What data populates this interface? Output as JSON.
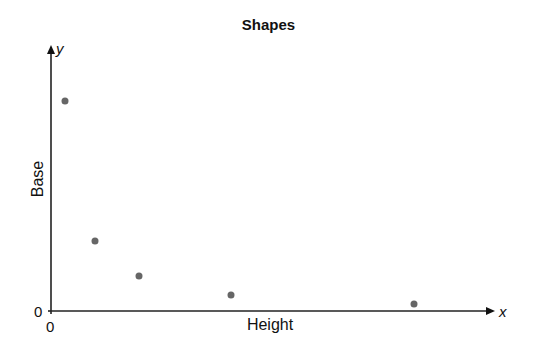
{
  "chart_data": {
    "type": "scatter",
    "title": "Shapes",
    "xlabel": "Height",
    "ylabel": "Base",
    "x_axis_letter": "x",
    "y_axis_letter": "y",
    "x_tick_labels": [
      "0"
    ],
    "y_tick_labels": [
      "0"
    ],
    "grid": false,
    "legend": null,
    "point_color": "#666666",
    "x": [
      3,
      10,
      20,
      40,
      80
    ],
    "y": [
      80,
      26,
      13,
      6,
      3
    ],
    "xlim": [
      0,
      97
    ],
    "ylim": [
      0,
      103
    ]
  },
  "layout": {
    "origin_px": [
      51,
      311
    ],
    "x_axis_end_px": 495,
    "y_axis_end_px": 45,
    "points_px": [
      [
        65,
        101
      ],
      [
        95,
        241
      ],
      [
        139,
        276
      ],
      [
        231,
        295
      ],
      [
        414,
        304
      ]
    ]
  }
}
